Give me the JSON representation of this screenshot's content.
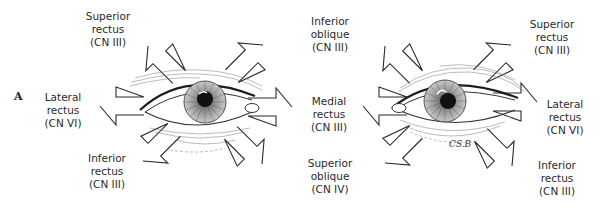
{
  "figure": {
    "panel_label": "A",
    "signature": "CS.B",
    "colors": {
      "line": "#2a2a2a",
      "pupil": "#111111",
      "background": "#ffffff"
    }
  },
  "left_eye": {
    "labels": {
      "superior_rectus": {
        "name": "Superior",
        "name2": "rectus",
        "nerve": "(CN III)"
      },
      "lateral_rectus": {
        "name": "Lateral",
        "name2": "rectus",
        "nerve": "(CN VI)"
      },
      "inferior_rectus": {
        "name": "Inferior",
        "name2": "rectus",
        "nerve": "(CN III)"
      },
      "inferior_oblique": {
        "name": "Inferior",
        "name2": "oblique",
        "nerve": "(CN III)"
      },
      "medial_rectus": {
        "name": "Medial",
        "name2": "rectus",
        "nerve": "(CN III)"
      },
      "superior_oblique": {
        "name": "Superior",
        "name2": "oblique",
        "nerve": "(CN IV)"
      }
    }
  },
  "right_eye": {
    "labels": {
      "superior_rectus": {
        "name": "Superior",
        "name2": "rectus",
        "nerve": "(CN III)"
      },
      "lateral_rectus": {
        "name": "Lateral",
        "name2": "rectus",
        "nerve": "(CN VI)"
      },
      "inferior_rectus": {
        "name": "Inferior",
        "name2": "rectus",
        "nerve": "(CN III)"
      }
    }
  }
}
